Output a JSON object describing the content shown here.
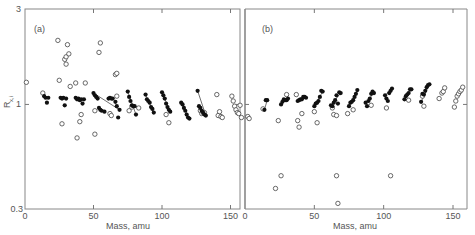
{
  "chart_data": [
    {
      "type": "scatter",
      "panel_label": "(a)",
      "xlabel": "Mass, amu",
      "ylabel": "R",
      "ylabel_subscript": "x,i",
      "yscale": "log",
      "xlim": [
        0,
        158
      ],
      "ylim": [
        0.3,
        3
      ],
      "xticks": [
        0,
        50,
        100,
        150
      ],
      "yticks": [
        0.3,
        1,
        3
      ],
      "series": [
        {
          "name": "filled",
          "marker": "filled-circle",
          "points": [
            [
              14,
              1.1
            ],
            [
              15,
              1.08
            ],
            [
              16,
              1.02
            ],
            [
              17,
              1.08
            ],
            [
              26,
              1.08
            ],
            [
              27,
              1.07
            ],
            [
              28,
              1.08
            ],
            [
              29,
              0.99
            ],
            [
              30,
              1.07
            ],
            [
              37,
              1.08
            ],
            [
              38,
              1.06
            ],
            [
              39,
              1.07
            ],
            [
              40,
              1.05
            ],
            [
              41,
              1.06
            ],
            [
              42,
              1.01
            ],
            [
              43,
              1.06
            ],
            [
              50,
              1.14
            ],
            [
              51,
              1.11
            ],
            [
              52,
              1.09
            ],
            [
              53,
              1.07
            ],
            [
              54,
              0.96
            ],
            [
              55,
              0.94
            ],
            [
              56,
              0.93
            ],
            [
              58,
              0.92
            ],
            [
              61,
              1.07
            ],
            [
              62,
              1.08
            ],
            [
              63,
              1.07
            ],
            [
              64,
              1.07
            ],
            [
              66,
              1.03
            ],
            [
              67,
              0.98
            ],
            [
              68,
              0.86
            ],
            [
              69,
              0.94
            ],
            [
              75,
              1.16
            ],
            [
              76,
              1.09
            ],
            [
              77,
              1.04
            ],
            [
              78,
              0.99
            ],
            [
              79,
              0.98
            ],
            [
              80,
              0.98
            ],
            [
              81,
              0.89
            ],
            [
              88,
              1.12
            ],
            [
              89,
              1.06
            ],
            [
              90,
              1.04
            ],
            [
              91,
              1.02
            ],
            [
              92,
              0.97
            ],
            [
              93,
              0.95
            ],
            [
              94,
              0.91
            ],
            [
              100,
              1.15
            ],
            [
              101,
              1.11
            ],
            [
              102,
              1.07
            ],
            [
              103,
              1.01
            ],
            [
              104,
              0.97
            ],
            [
              105,
              0.94
            ],
            [
              106,
              0.92
            ],
            [
              114,
              1.02
            ],
            [
              115,
              1.0
            ],
            [
              116,
              0.96
            ],
            [
              117,
              0.93
            ],
            [
              118,
              0.89
            ],
            [
              119,
              0.86
            ],
            [
              120,
              0.85
            ],
            [
              126,
              1.17
            ],
            [
              127,
              0.98
            ],
            [
              128,
              0.96
            ],
            [
              129,
              0.93
            ],
            [
              130,
              0.91
            ],
            [
              131,
              0.89
            ],
            [
              132,
              0.88
            ]
          ]
        },
        {
          "name": "open",
          "marker": "open-circle",
          "points": [
            [
              1,
              1.29
            ],
            [
              13,
              1.14
            ],
            [
              24,
              2.09
            ],
            [
              25,
              1.32
            ],
            [
              27,
              0.8
            ],
            [
              29,
              1.68
            ],
            [
              30,
              1.73
            ],
            [
              30,
              1.59
            ],
            [
              31,
              1.99
            ],
            [
              32,
              1.79
            ],
            [
              33,
              1.23
            ],
            [
              37,
              1.28
            ],
            [
              38,
              0.68
            ],
            [
              40,
              0.82
            ],
            [
              41,
              0.89
            ],
            [
              44,
              1.28
            ],
            [
              51,
              0.93
            ],
            [
              51,
              0.71
            ],
            [
              54,
              1.82
            ],
            [
              55,
              2.03
            ],
            [
              62,
              0.9
            ],
            [
              63,
              0.88
            ],
            [
              66,
              1.41
            ],
            [
              67,
              1.43
            ],
            [
              67,
              1.1
            ],
            [
              76,
              0.93
            ],
            [
              78,
              0.97
            ],
            [
              83,
              0.96
            ],
            [
              103,
              0.89
            ],
            [
              105,
              0.81
            ],
            [
              128,
              0.93
            ],
            [
              129,
              0.9
            ],
            [
              130,
              0.91
            ],
            [
              131,
              0.91
            ],
            [
              140,
              1.12
            ],
            [
              141,
              0.88
            ],
            [
              142,
              0.92
            ],
            [
              143,
              0.87
            ],
            [
              144,
              0.86
            ],
            [
              151,
              1.1
            ],
            [
              152,
              1.04
            ],
            [
              153,
              0.98
            ],
            [
              154,
              0.94
            ],
            [
              155,
              0.91
            ],
            [
              156,
              0.9
            ],
            [
              157,
              0.99
            ],
            [
              158,
              0.86
            ]
          ]
        }
      ]
    },
    {
      "type": "scatter",
      "panel_label": "(b)",
      "xlabel": "Mass, amu",
      "yscale": "log",
      "xlim": [
        0,
        160
      ],
      "ylim": [
        0.3,
        3
      ],
      "xticks": [
        0,
        50,
        100,
        150
      ],
      "series": [
        {
          "name": "filled",
          "marker": "filled-circle",
          "points": [
            [
              14,
              0.94
            ],
            [
              15,
              1.05
            ],
            [
              16,
              1.05
            ],
            [
              26,
              1.0
            ],
            [
              27,
              1.03
            ],
            [
              28,
              1.06
            ],
            [
              29,
              1.05
            ],
            [
              30,
              1.05
            ],
            [
              31,
              1.07
            ],
            [
              38,
              1.04
            ],
            [
              39,
              1.05
            ],
            [
              40,
              1.06
            ],
            [
              41,
              1.06
            ],
            [
              42,
              1.09
            ],
            [
              43,
              1.09
            ],
            [
              44,
              1.08
            ],
            [
              50,
              0.98
            ],
            [
              51,
              1.01
            ],
            [
              52,
              1.02
            ],
            [
              53,
              1.04
            ],
            [
              54,
              1.09
            ],
            [
              55,
              1.17
            ],
            [
              56,
              1.16
            ],
            [
              62,
              0.99
            ],
            [
              63,
              0.98
            ],
            [
              64,
              1.02
            ],
            [
              65,
              1.05
            ],
            [
              66,
              1.11
            ],
            [
              67,
              1.01
            ],
            [
              68,
              1.15
            ],
            [
              69,
              1.14
            ],
            [
              75,
              0.98
            ],
            [
              76,
              1.02
            ],
            [
              77,
              1.03
            ],
            [
              78,
              1.05
            ],
            [
              79,
              1.09
            ],
            [
              80,
              1.13
            ],
            [
              81,
              1.18
            ],
            [
              87,
              1.02
            ],
            [
              88,
              0.98
            ],
            [
              89,
              1.04
            ],
            [
              90,
              1.07
            ],
            [
              91,
              1.13
            ],
            [
              92,
              1.16
            ],
            [
              93,
              1.14
            ],
            [
              101,
              1.11
            ],
            [
              102,
              1.07
            ],
            [
              103,
              1.04
            ],
            [
              104,
              1.14
            ],
            [
              105,
              1.17
            ],
            [
              106,
              1.2
            ],
            [
              115,
              1.06
            ],
            [
              116,
              1.1
            ],
            [
              117,
              1.12
            ],
            [
              118,
              1.14
            ],
            [
              119,
              1.19
            ],
            [
              120,
              1.19
            ],
            [
              127,
              1.03
            ],
            [
              128,
              1.13
            ],
            [
              129,
              1.12
            ],
            [
              130,
              1.17
            ],
            [
              131,
              1.22
            ],
            [
              132,
              1.25
            ],
            [
              133,
              1.26
            ]
          ]
        },
        {
          "name": "open",
          "marker": "open-circle",
          "points": [
            [
              2,
              0.87
            ],
            [
              3,
              0.85
            ],
            [
              13,
              0.95
            ],
            [
              22,
              0.38
            ],
            [
              24,
              0.83
            ],
            [
              26,
              0.44
            ],
            [
              30,
              1.12
            ],
            [
              37,
              1.12
            ],
            [
              38,
              0.83
            ],
            [
              39,
              0.77
            ],
            [
              41,
              0.9
            ],
            [
              50,
              0.92
            ],
            [
              52,
              0.81
            ],
            [
              63,
              0.96
            ],
            [
              64,
              0.89
            ],
            [
              66,
              0.88
            ],
            [
              66,
              0.44
            ],
            [
              67,
              0.32
            ],
            [
              74,
              0.9
            ],
            [
              78,
              0.94
            ],
            [
              91,
              0.99
            ],
            [
              102,
              0.96
            ],
            [
              105,
              0.44
            ],
            [
              118,
              1.05
            ],
            [
              128,
              1.1
            ],
            [
              129,
              0.98
            ],
            [
              140,
              1.07
            ],
            [
              142,
              1.14
            ],
            [
              143,
              1.16
            ],
            [
              144,
              1.21
            ],
            [
              151,
              0.97
            ],
            [
              152,
              1.04
            ],
            [
              153,
              1.1
            ],
            [
              154,
              1.13
            ],
            [
              155,
              1.16
            ],
            [
              156,
              1.18
            ],
            [
              157,
              1.22
            ]
          ]
        }
      ]
    }
  ],
  "panels": {
    "a": {
      "label": "(a)"
    },
    "b": {
      "label": "(b)"
    }
  },
  "axes": {
    "xlabel": "Mass, amu",
    "ylabel_main": "R",
    "ylabel_sub": "x,i",
    "ytick_labels": [
      "3",
      "1",
      "0.3"
    ],
    "xtick_labels": [
      "0",
      "50",
      "100",
      "150"
    ]
  },
  "colors": {
    "axis": "#777777",
    "marker": "#111111",
    "text": "#555555"
  }
}
